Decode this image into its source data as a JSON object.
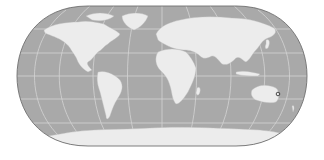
{
  "map": {
    "projection": "Eckert IV (pseudocylindrical, rounded sides)",
    "style": "grayscale world map with graticule",
    "colors": {
      "background": "#ffffff",
      "ocean": "#a9a9a9",
      "land": "#ececec",
      "graticule": "#d4d4d4",
      "outline": "#6f6f6f",
      "marker": "#3a3a3a"
    },
    "graticule": {
      "parallels_deg": [
        -60,
        -30,
        0,
        30,
        60
      ],
      "meridians_deg": [
        -150,
        -120,
        -90,
        -60,
        -30,
        0,
        30,
        60,
        90,
        120,
        150
      ]
    },
    "continents": [
      "North America",
      "Greenland",
      "South America",
      "Europe",
      "Africa",
      "Asia",
      "Australia",
      "Antarctica"
    ],
    "marker": {
      "label": "",
      "shape": "small ring",
      "location": "eastern Australia"
    }
  }
}
